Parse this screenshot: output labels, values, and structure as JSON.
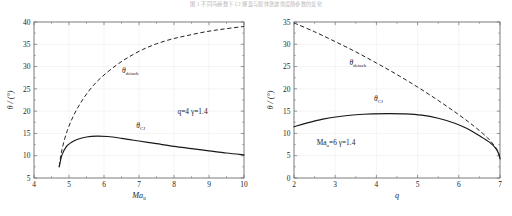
{
  "figure": {
    "caption": "图  1    不同马赫数下 CJ 爆轰与脱体激波角度随参数的变化"
  },
  "chart_data": [
    {
      "id": "left",
      "type": "line",
      "title": "",
      "xlabel": "Ma",
      "xlabel_sub": "u",
      "ylabel": "θ / (°)",
      "xlim": [
        4,
        10
      ],
      "ylim": [
        5,
        40
      ],
      "xticks": [
        4,
        5,
        6,
        7,
        8,
        9,
        10
      ],
      "yticks": [
        5,
        10,
        15,
        20,
        25,
        30,
        35,
        40
      ],
      "xtick_labels": [
        "4",
        "5",
        "6",
        "7",
        "8",
        "9",
        "10"
      ],
      "ytick_labels": [
        "5",
        "10",
        "15",
        "20",
        "25",
        "30",
        "35",
        "40"
      ],
      "grid": true,
      "legend": "none",
      "annotations": [
        {
          "name": "theta-detach-label",
          "text": "θ",
          "sub": "detach",
          "x": 6.75,
          "y": 28.6
        },
        {
          "name": "theta-cj-label",
          "text": "θ",
          "sub": "CJ",
          "x": 7.05,
          "y": 16.2
        },
        {
          "name": "parameters",
          "text": "q=4   γ=1.4",
          "x": 8.1,
          "y": 19.4
        }
      ],
      "series": [
        {
          "name": "theta_detach",
          "style": "dashed",
          "x": [
            4.72,
            4.8,
            4.95,
            5.15,
            5.4,
            5.7,
            6.0,
            6.35,
            6.7,
            7.1,
            7.5,
            7.95,
            8.4,
            8.9,
            9.4,
            10.0
          ],
          "y": [
            7.6,
            11.4,
            15.6,
            19.3,
            22.7,
            25.8,
            28.1,
            30.3,
            32.1,
            33.8,
            35.1,
            36.2,
            37.0,
            37.8,
            38.4,
            39.0
          ]
        },
        {
          "name": "theta_CJ",
          "style": "solid",
          "x": [
            4.72,
            4.8,
            4.92,
            5.05,
            5.25,
            5.5,
            5.8,
            6.1,
            6.5,
            7.0,
            7.5,
            8.0,
            8.5,
            9.0,
            9.5,
            10.0
          ],
          "y": [
            7.5,
            10.2,
            12.0,
            12.9,
            13.7,
            14.2,
            14.4,
            14.3,
            13.9,
            13.3,
            12.7,
            12.1,
            11.6,
            11.1,
            10.6,
            10.2
          ]
        }
      ]
    },
    {
      "id": "right",
      "type": "line",
      "title": "",
      "xlabel": "q",
      "xlabel_sub": "",
      "ylabel": "θ / (°)",
      "xlim": [
        2,
        7
      ],
      "ylim": [
        0,
        35
      ],
      "xticks": [
        2,
        3,
        4,
        5,
        6,
        7
      ],
      "yticks": [
        0,
        5,
        10,
        15,
        20,
        25,
        30,
        35
      ],
      "xtick_labels": [
        "2",
        "3",
        "4",
        "5",
        "6",
        "7"
      ],
      "ytick_labels": [
        "0",
        "5",
        "10",
        "15",
        "20",
        "25",
        "30",
        "35"
      ],
      "grid": true,
      "legend": "none",
      "annotations": [
        {
          "name": "theta-detach-label",
          "text": "θ",
          "sub": "detach",
          "x": 3.55,
          "y": 25.4
        },
        {
          "name": "theta-cj-label",
          "text": "θ",
          "sub": "CJ",
          "x": 4.05,
          "y": 17.2
        },
        {
          "name": "parameters",
          "text": "Ma",
          "sub": "u",
          "text2": "=6   γ=1.4",
          "x": 2.55,
          "y": 7.4
        }
      ],
      "series": [
        {
          "name": "theta_detach",
          "style": "dashed",
          "x": [
            2.0,
            2.5,
            3.0,
            3.5,
            4.0,
            4.5,
            5.0,
            5.5,
            6.0,
            6.4,
            6.7,
            6.85,
            6.95,
            7.0
          ],
          "y": [
            34.8,
            32.8,
            30.6,
            28.3,
            25.8,
            23.2,
            20.4,
            17.4,
            14.2,
            11.4,
            9.0,
            7.4,
            6.0,
            4.3
          ]
        },
        {
          "name": "theta_CJ",
          "style": "solid",
          "x": [
            2.0,
            2.3,
            2.7,
            3.1,
            3.5,
            3.9,
            4.3,
            4.7,
            5.1,
            5.5,
            5.9,
            6.2,
            6.5,
            6.75,
            6.9,
            6.97,
            7.0
          ],
          "y": [
            11.5,
            12.3,
            13.2,
            13.8,
            14.2,
            14.4,
            14.45,
            14.4,
            14.1,
            13.4,
            12.3,
            11.1,
            9.5,
            8.0,
            6.6,
            5.4,
            4.3
          ]
        }
      ]
    }
  ]
}
